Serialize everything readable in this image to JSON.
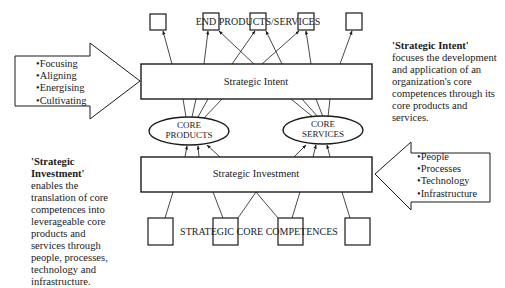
{
  "diagram": {
    "top_label": "END PRODUCTS/SERVICES",
    "bottom_label": "STRATEGIC CORE COMPETENCES",
    "intent_box": {
      "label": "Strategic Intent"
    },
    "investment_box": {
      "label": "Strategic Investment"
    },
    "core_products": {
      "line1": "CORE",
      "line2": "PRODUCTS"
    },
    "core_services": {
      "line1": "CORE",
      "line2": "SERVICES"
    },
    "left_arrow": {
      "items": [
        "Focusing",
        "Aligning",
        "Energising",
        "Cultivating"
      ]
    },
    "right_arrow": {
      "items": [
        "People",
        "Processes",
        "Technology",
        "Infrastructure"
      ]
    },
    "intent_description": {
      "term": "'Strategic Intent'",
      "text": " focuses the development and application of an organization's core competences through its core products and services."
    },
    "investment_description": {
      "term": "'Strategic Investment'",
      "text": " enables the translation of core competences into leverageable core products and services through people, processes, technology and infrastructure."
    },
    "colors": {
      "line": "#1a1a1a",
      "background": "#ffffff"
    }
  }
}
